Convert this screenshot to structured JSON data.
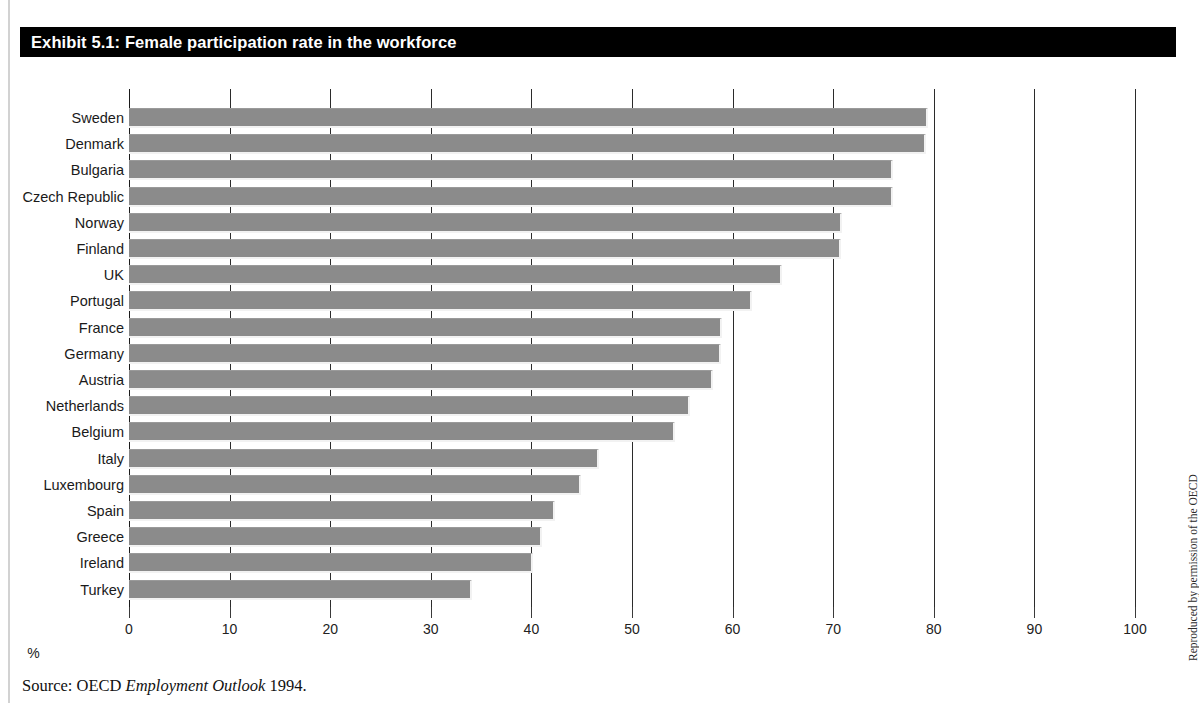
{
  "exhibit": {
    "title": "Exhibit 5.1: Female participation rate in the workforce",
    "source_prefix": "Source: OECD ",
    "source_italic": "Employment Outlook",
    "source_suffix": " 1994.",
    "credit": "Reproduced by permission of the OECD"
  },
  "colors": {
    "banner_bg": "#000000",
    "banner_text": "#ffffff",
    "bar_fill": "#8b8b8b",
    "bar_highlight": "#f2f2f2",
    "gridline": "#1a1a1a",
    "page_rule": "#d2d2d2"
  },
  "chart_data": {
    "type": "bar",
    "orientation": "horizontal",
    "title": "Exhibit 5.1: Female participation rate in the workforce",
    "xlabel": "%",
    "ylabel": "",
    "xlim": [
      0,
      100
    ],
    "xticks": [
      0,
      10,
      20,
      30,
      40,
      50,
      60,
      70,
      80,
      90,
      100
    ],
    "xticklabels": [
      "0",
      "10",
      "20",
      "30",
      "40",
      "50",
      "60",
      "70",
      "80",
      "90",
      "100"
    ],
    "grid": true,
    "legend": null,
    "categories": [
      "Sweden",
      "Denmark",
      "Bulgaria",
      "Czech Republic",
      "Norway",
      "Finland",
      "UK",
      "Portugal",
      "France",
      "Germany",
      "Austria",
      "Netherlands",
      "Belgium",
      "Italy",
      "Luxembourg",
      "Spain",
      "Greece",
      "Ireland",
      "Turkey"
    ],
    "values": [
      79.4,
      79.2,
      75.9,
      75.9,
      70.9,
      70.8,
      64.9,
      61.9,
      58.9,
      58.8,
      58.1,
      55.8,
      54.3,
      46.7,
      44.9,
      42.3,
      41.1,
      40.2,
      34.1
    ]
  }
}
